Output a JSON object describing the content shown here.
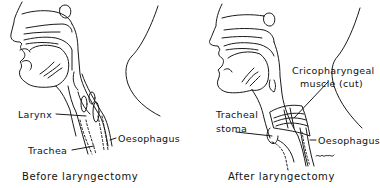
{
  "panels": [
    {
      "caption": "Before laryngectomy",
      "labels": {
        "larynx": "Larynx",
        "oesophagus": "Oesophagus",
        "trachea": "Trachea"
      }
    },
    {
      "caption": "After laryngectomy",
      "labels": {
        "cricopharyngeal_line1": "Cricopharyngeal",
        "cricopharyngeal_line2": "muscle (cut)",
        "tracheal_stoma_line1": "Tracheal",
        "tracheal_stoma_line2": "stoma",
        "oesophagus": "Oesophagus"
      },
      "signature": "Y.HARRIS"
    }
  ],
  "colors": {
    "ink": "#1a1a1a",
    "background": "#ffffff"
  }
}
